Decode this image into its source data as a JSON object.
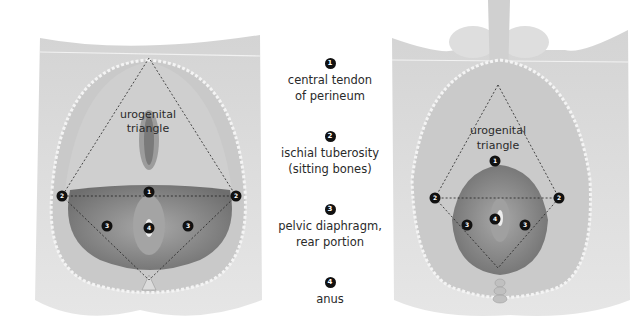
{
  "legend": {
    "items": [
      {
        "number": "1",
        "label": "central tendon\nof perineum"
      },
      {
        "number": "2",
        "label": "ischial tuberosity\n(sitting bones)"
      },
      {
        "number": "3",
        "label": "pelvic diaphragm,\nrear portion"
      },
      {
        "number": "4",
        "label": "anus"
      }
    ]
  },
  "left_figure": {
    "title_line1": "urogenital",
    "title_line2": "triangle",
    "markers": [
      "1",
      "2",
      "2",
      "3",
      "3",
      "4"
    ]
  },
  "right_figure": {
    "title_line1": "urogenital",
    "title_line2": "triangle",
    "markers": [
      "1",
      "2",
      "2",
      "3",
      "3",
      "4"
    ]
  },
  "colors": {
    "skin": "#d8d8d8",
    "skin_dark": "#bdbdbd",
    "muscle": "#8e8e8e",
    "marker": "#111111",
    "background": "#ffffff"
  }
}
